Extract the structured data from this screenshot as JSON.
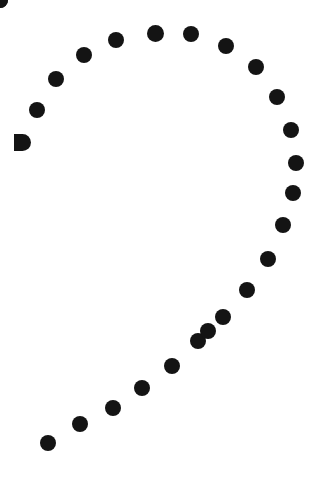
{
  "image": {
    "title": "Dotted teardrop outline",
    "width": 327,
    "height": 499,
    "background_color": "#ffffff",
    "dot_color": "#141414",
    "dot_count": 26,
    "shape_description": "open teardrop / paisley outline drawn with evenly spaced filled circles"
  },
  "chart_data": {
    "type": "scatter",
    "subtitle": "",
    "xlabel": "",
    "ylabel": "",
    "xlim": [
      0,
      327
    ],
    "ylim": [
      0,
      499
    ],
    "grid": false,
    "legend": null,
    "axes_visible": false,
    "marker": {
      "shape": "circle",
      "color": "#141414",
      "diameter_px": 16
    },
    "series": [
      {
        "name": "teardrop-outline",
        "color": "#141414",
        "points": [
          {
            "id": "d01",
            "x": 22,
            "y": 142,
            "d": 17,
            "clipped": true,
            "segment": "left-arc"
          },
          {
            "id": "d02",
            "x": 37,
            "y": 110,
            "d": 16,
            "clipped": false,
            "segment": "left-arc"
          },
          {
            "id": "d03",
            "x": 56,
            "y": 79,
            "d": 16,
            "clipped": false,
            "segment": "left-arc"
          },
          {
            "id": "d04",
            "x": 84,
            "y": 55,
            "d": 16,
            "clipped": false,
            "segment": "left-arc"
          },
          {
            "id": "d05",
            "x": 116,
            "y": 40,
            "d": 16,
            "clipped": false,
            "segment": "top-arc"
          },
          {
            "id": "d06",
            "x": 155,
            "y": 33,
            "d": 17,
            "clipped": false,
            "segment": "top-arc"
          },
          {
            "id": "d07",
            "x": 191,
            "y": 34,
            "d": 16,
            "clipped": false,
            "segment": "top-arc"
          },
          {
            "id": "d08",
            "x": 226,
            "y": 46,
            "d": 16,
            "clipped": false,
            "segment": "right-arc"
          },
          {
            "id": "d09",
            "x": 256,
            "y": 67,
            "d": 16,
            "clipped": false,
            "segment": "right-arc"
          },
          {
            "id": "d10",
            "x": 277,
            "y": 97,
            "d": 16,
            "clipped": false,
            "segment": "right-arc"
          },
          {
            "id": "d11",
            "x": 291,
            "y": 130,
            "d": 16,
            "clipped": false,
            "segment": "right-arc"
          },
          {
            "id": "d12",
            "x": 296,
            "y": 163,
            "d": 16,
            "clipped": false,
            "segment": "right-arc"
          },
          {
            "id": "d13",
            "x": 293,
            "y": 193,
            "d": 16,
            "clipped": false,
            "segment": "right-arc"
          },
          {
            "id": "d14",
            "x": 283,
            "y": 225,
            "d": 16,
            "clipped": false,
            "segment": "right-arc"
          },
          {
            "id": "d15",
            "x": 268,
            "y": 259,
            "d": 16,
            "clipped": false,
            "segment": "right-arc"
          },
          {
            "id": "d16",
            "x": 247,
            "y": 290,
            "d": 16,
            "clipped": false,
            "segment": "diagonal"
          },
          {
            "id": "d17",
            "x": 223,
            "y": 317,
            "d": 16,
            "clipped": false,
            "segment": "diagonal"
          },
          {
            "id": "d18",
            "x": 198,
            "y": 341,
            "d": 16,
            "clipped": false,
            "segment": "diagonal"
          },
          {
            "id": "d19",
            "x": 172,
            "y": 366,
            "d": 16,
            "clipped": false,
            "segment": "diagonal"
          },
          {
            "id": "d20",
            "x": 142,
            "y": 388,
            "d": 16,
            "clipped": false,
            "segment": "diagonal"
          },
          {
            "id": "d21",
            "x": 113,
            "y": 408,
            "d": 16,
            "clipped": false,
            "segment": "diagonal"
          },
          {
            "id": "d22",
            "x": 80,
            "y": 424,
            "d": 16,
            "clipped": false,
            "segment": "diagonal"
          },
          {
            "id": "d23",
            "x": 48,
            "y": 443,
            "d": 16,
            "clipped": false,
            "segment": "diagonal"
          },
          {
            "id": "d24",
            "x": 208,
            "y": 331,
            "d": 0,
            "clipped": false,
            "segment": "unused"
          },
          {
            "id": "d25",
            "x": 0,
            "y": 0,
            "d": 0,
            "clipped": false,
            "segment": "unused"
          },
          {
            "id": "d26",
            "x": 0,
            "y": 0,
            "d": 0,
            "clipped": false,
            "segment": "unused"
          }
        ]
      }
    ]
  }
}
